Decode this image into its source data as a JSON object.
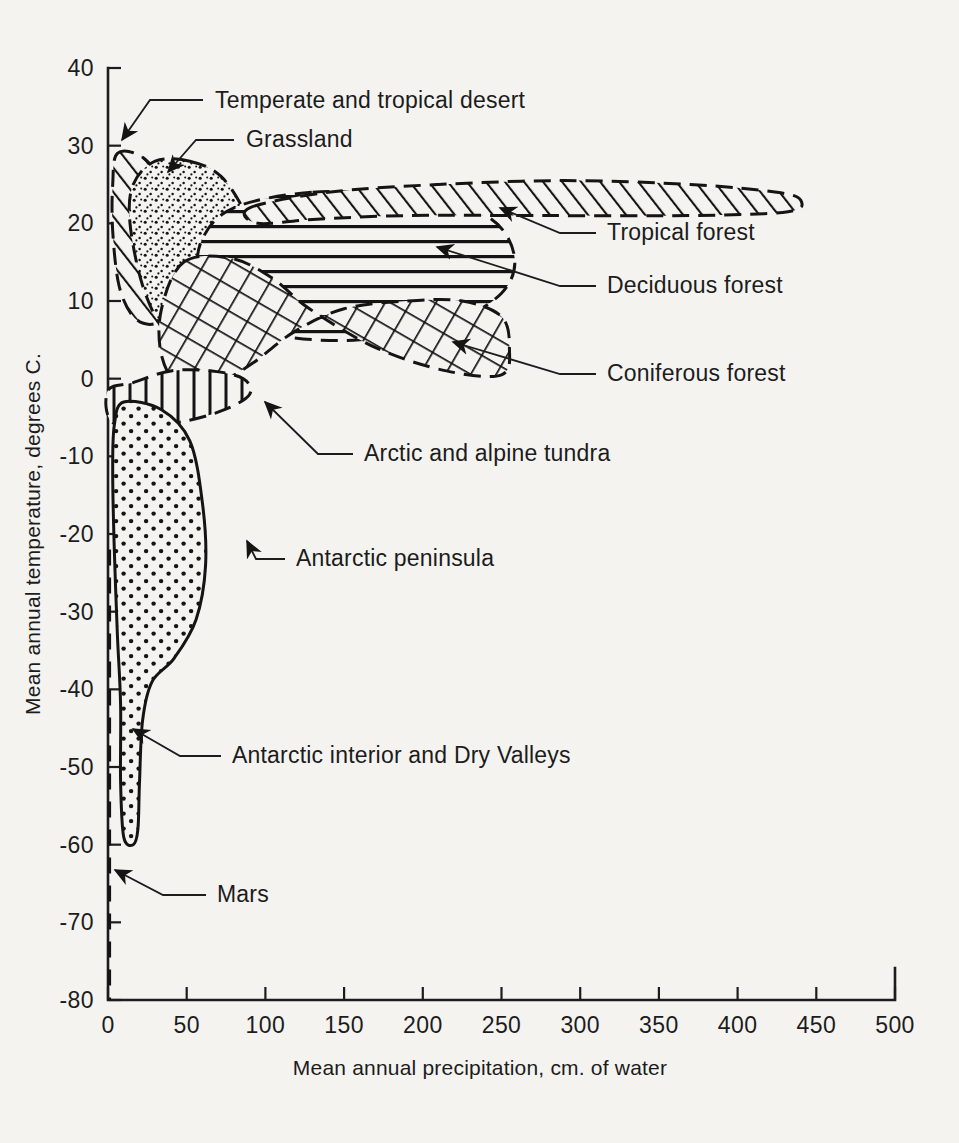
{
  "figure": {
    "background_color": "#f4f3f0",
    "ink_color": "#141414"
  },
  "axes": {
    "x": {
      "label": "Mean annual precipitation, cm. of water",
      "min": 0,
      "max": 500,
      "tick_step": 50,
      "ticks": [
        "0",
        "50",
        "100",
        "150",
        "200",
        "250",
        "300",
        "350",
        "400",
        "450",
        "500"
      ]
    },
    "y": {
      "label": "Mean annual temperature, degrees C.",
      "min": -80,
      "max": 40,
      "tick_step": 10,
      "ticks": [
        "40",
        "30",
        "20",
        "10",
        "0",
        "-10",
        "-20",
        "-30",
        "-40",
        "-50",
        "-60",
        "-70",
        "-80"
      ]
    }
  },
  "annotations": [
    {
      "id": "desert",
      "label": "Temperate and tropical desert",
      "text_x": 215,
      "text_y": 108,
      "lead": "M 203 100 L 150 100 L 122 140",
      "arrow_at": [
        122,
        140
      ],
      "arrow_angle": 125
    },
    {
      "id": "grassland",
      "label": "Grassland",
      "text_x": 246,
      "text_y": 147,
      "lead": "M 234 140 L 196 140 L 168 172",
      "arrow_at": [
        168,
        172
      ],
      "arrow_angle": 131
    },
    {
      "id": "tropical",
      "label": "Tropical forest",
      "text_x": 607,
      "text_y": 240,
      "lead": "M 596 233 L 560 233 L 500 208",
      "arrow_at": [
        500,
        208
      ],
      "arrow_angle": 203
    },
    {
      "id": "deciduous",
      "label": "Deciduous forest",
      "text_x": 607,
      "text_y": 293,
      "lead": "M 596 286 L 560 286 L 437 247",
      "arrow_at": [
        437,
        247
      ],
      "arrow_angle": 197
    },
    {
      "id": "coniferous",
      "label": "Coniferous forest",
      "text_x": 607,
      "text_y": 381,
      "lead": "M 596 374 L 560 374 L 453 342",
      "arrow_at": [
        453,
        342
      ],
      "arrow_angle": 197
    },
    {
      "id": "tundra",
      "label": "Arctic and alpine tundra",
      "text_x": 364,
      "text_y": 461,
      "lead": "M 353 454 L 318 454 L 265 402",
      "arrow_at": [
        265,
        402
      ],
      "arrow_angle": 224
    },
    {
      "id": "peninsula",
      "label": "Antarctic peninsula",
      "text_x": 296,
      "text_y": 566,
      "lead": "M 285 559 L 256 559 L 247 541",
      "arrow_at": [
        247,
        541
      ],
      "arrow_angle": 243
    },
    {
      "id": "interior",
      "label": "Antarctic interior and Dry Valleys",
      "text_x": 232,
      "text_y": 763,
      "lead": "M 221 756 L 180 756 L 133 729",
      "arrow_at": [
        133,
        729
      ],
      "arrow_angle": 210
    },
    {
      "id": "mars",
      "label": "Mars",
      "text_x": 217,
      "text_y": 902,
      "lead": "M 206 895 L 163 895 L 115 870",
      "arrow_at": [
        115,
        870
      ],
      "arrow_angle": 208
    }
  ],
  "chart_data": {
    "type": "scatter",
    "title": "",
    "subtitle": "",
    "xlabel": "Mean annual precipitation, cm. of water",
    "ylabel": "Mean annual temperature, degrees C.",
    "xlim": [
      0,
      500
    ],
    "ylim": [
      -80,
      40
    ],
    "grid": false,
    "legend": "none",
    "regions": [
      {
        "name": "Temperate and tropical desert",
        "pattern": "diagonal-hatch-forward",
        "outline": "dashed",
        "precip_range_cm": [
          0,
          42
        ],
        "temp_range_c": [
          7,
          29
        ],
        "polygon": [
          [
            6,
            29
          ],
          [
            22,
            28.5
          ],
          [
            34,
            25
          ],
          [
            40,
            19
          ],
          [
            41,
            13
          ],
          [
            37,
            8.5
          ],
          [
            28,
            7
          ],
          [
            16,
            8
          ],
          [
            7,
            12
          ],
          [
            3,
            19
          ],
          [
            3,
            25
          ]
        ]
      },
      {
        "name": "Grassland",
        "pattern": "stipple-fine",
        "outline": "dashed",
        "precip_range_cm": [
          12,
          100
        ],
        "temp_range_c": [
          3,
          28
        ],
        "polygon": [
          [
            52,
            28
          ],
          [
            72,
            26
          ],
          [
            88,
            21
          ],
          [
            98,
            15
          ],
          [
            100,
            9
          ],
          [
            92,
            5
          ],
          [
            74,
            3
          ],
          [
            54,
            3
          ],
          [
            36,
            6
          ],
          [
            22,
            12
          ],
          [
            14,
            20
          ],
          [
            16,
            25
          ],
          [
            30,
            28
          ]
        ]
      },
      {
        "name": "Tropical forest",
        "pattern": "diagonal-hatch-forward",
        "outline": "dashed",
        "precip_range_cm": [
          85,
          440
        ],
        "temp_range_c": [
          20,
          26
        ],
        "polygon": [
          [
            90,
            22
          ],
          [
            140,
            24
          ],
          [
            210,
            25
          ],
          [
            290,
            25.5
          ],
          [
            370,
            25
          ],
          [
            425,
            24
          ],
          [
            440,
            23
          ],
          [
            432,
            21.5
          ],
          [
            370,
            21
          ],
          [
            280,
            21
          ],
          [
            190,
            21
          ],
          [
            130,
            20.5
          ],
          [
            95,
            20
          ]
        ]
      },
      {
        "name": "Deciduous forest",
        "pattern": "horizontal-lines",
        "outline": "dashed",
        "precip_range_cm": [
          55,
          260
        ],
        "temp_range_c": [
          5,
          24
        ],
        "polygon": [
          [
            130,
            24
          ],
          [
            190,
            23.5
          ],
          [
            240,
            21
          ],
          [
            258,
            16
          ],
          [
            250,
            11
          ],
          [
            215,
            7
          ],
          [
            160,
            5
          ],
          [
            110,
            5.5
          ],
          [
            74,
            8
          ],
          [
            58,
            13
          ],
          [
            60,
            18
          ],
          [
            80,
            22
          ]
        ]
      },
      {
        "name": "Coniferous forest",
        "pattern": "cross-hatch",
        "outline": "dashed",
        "precip_range_cm": [
          30,
          255
        ],
        "temp_range_c": [
          -1,
          15
        ],
        "polygon": [
          [
            48,
            15
          ],
          [
            78,
            15.5
          ],
          [
            104,
            13
          ],
          [
            128,
            9
          ],
          [
            170,
            4
          ],
          [
            215,
            1
          ],
          [
            250,
            0.5
          ],
          [
            255,
            4
          ],
          [
            250,
            8
          ],
          [
            225,
            10
          ],
          [
            190,
            10
          ],
          [
            150,
            9
          ],
          [
            118,
            6
          ],
          [
            92,
            2
          ],
          [
            70,
            -0.5
          ],
          [
            46,
            -1
          ],
          [
            34,
            3
          ],
          [
            34,
            9
          ]
        ]
      },
      {
        "name": "Arctic and alpine tundra",
        "pattern": "vertical-lines",
        "outline": "dashed",
        "precip_range_cm": [
          0,
          90
        ],
        "temp_range_c": [
          -6,
          1
        ],
        "polygon": [
          [
            0,
            -1.5
          ],
          [
            16,
            -0.5
          ],
          [
            40,
            1
          ],
          [
            66,
            1
          ],
          [
            86,
            0
          ],
          [
            90,
            -2
          ],
          [
            74,
            -4
          ],
          [
            48,
            -5.5
          ],
          [
            22,
            -6
          ],
          [
            2,
            -5.5
          ]
        ]
      },
      {
        "name": "Antarctic peninsula",
        "pattern": "stipple-coarse",
        "outline": "solid",
        "precip_range_cm": [
          0,
          62
        ],
        "temp_range_c": [
          -60,
          -3
        ],
        "polygon": [
          [
            10,
            -3
          ],
          [
            34,
            -4
          ],
          [
            52,
            -8
          ],
          [
            60,
            -16
          ],
          [
            62,
            -24
          ],
          [
            56,
            -31
          ],
          [
            42,
            -36
          ],
          [
            28,
            -39
          ],
          [
            22,
            -44
          ],
          [
            20,
            -52
          ],
          [
            19,
            -58
          ],
          [
            16,
            -60
          ],
          [
            10,
            -59
          ],
          [
            8,
            -52
          ],
          [
            8,
            -42
          ],
          [
            6,
            -33
          ],
          [
            4,
            -22
          ],
          [
            3,
            -12
          ],
          [
            4,
            -6
          ]
        ]
      },
      {
        "name": "Antarctic interior and Dry Valleys",
        "pattern": "stipple-coarse",
        "outline": "solid",
        "precip_range_cm": [
          0,
          22
        ],
        "temp_range_c": [
          -60,
          -36
        ],
        "polygon": [
          [
            4,
            -36
          ],
          [
            22,
            -42
          ],
          [
            20,
            -52
          ],
          [
            19,
            -58
          ],
          [
            16,
            -60
          ],
          [
            10,
            -59
          ],
          [
            8,
            -52
          ],
          [
            8,
            -44
          ]
        ]
      },
      {
        "name": "Mars",
        "pattern": "dashed-line",
        "outline": "dashed",
        "precip_range_cm": [
          0,
          0
        ],
        "temp_range_c": [
          -80,
          -22
        ],
        "polyline": [
          [
            1,
            -22
          ],
          [
            1,
            -80
          ]
        ]
      }
    ]
  }
}
